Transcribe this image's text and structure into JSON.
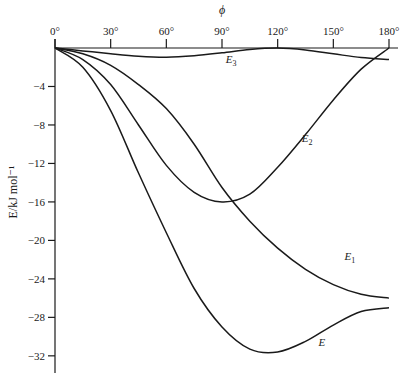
{
  "chart_data": {
    "type": "line",
    "title": "",
    "xlabel": "ϕ",
    "ylabel": "E/kJ mol⁻¹",
    "xlim": [
      0,
      180
    ],
    "ylim": [
      -34,
      0
    ],
    "x_ticks": [
      0,
      30,
      60,
      90,
      120,
      150,
      180
    ],
    "x_tick_labels": [
      "0°",
      "30°",
      "60°",
      "90°",
      "120°",
      "150°",
      "180°"
    ],
    "y_ticks": [
      -4,
      -8,
      -12,
      -16,
      -20,
      -24,
      -28,
      -32
    ],
    "y_tick_labels": [
      "−4",
      "−8",
      "−12",
      "−16",
      "−20",
      "−24",
      "−28",
      "−32"
    ],
    "x_axis_position": "top",
    "grid": false,
    "legend": "inline labels",
    "series": [
      {
        "name": "E3",
        "label_main": "E",
        "label_sub": "3",
        "x": [
          0,
          15,
          30,
          45,
          60,
          75,
          90,
          105,
          120,
          135,
          150,
          165,
          180
        ],
        "values": [
          0,
          -0.3,
          -0.6,
          -0.85,
          -0.95,
          -0.8,
          -0.5,
          -0.15,
          0,
          -0.2,
          -0.6,
          -1.0,
          -1.2
        ]
      },
      {
        "name": "E2",
        "label_main": "E",
        "label_sub": "2",
        "x": [
          0,
          15,
          30,
          45,
          60,
          75,
          90,
          105,
          120,
          135,
          150,
          165,
          180
        ],
        "values": [
          0,
          -1.2,
          -3.8,
          -8.0,
          -12.2,
          -15.0,
          -16.0,
          -15.2,
          -12.4,
          -9.0,
          -5.4,
          -2.2,
          0
        ]
      },
      {
        "name": "E1",
        "label_main": "E",
        "label_sub": "1",
        "x": [
          0,
          15,
          30,
          45,
          60,
          75,
          90,
          105,
          120,
          135,
          150,
          165,
          180
        ],
        "values": [
          0,
          -0.6,
          -1.8,
          -3.8,
          -6.3,
          -10.0,
          -14.5,
          -18.0,
          -20.8,
          -23.0,
          -24.6,
          -25.6,
          -26.0
        ]
      },
      {
        "name": "E",
        "label_main": "E",
        "label_sub": "",
        "x": [
          0,
          15,
          30,
          45,
          60,
          75,
          90,
          105,
          120,
          135,
          150,
          165,
          180
        ],
        "values": [
          0,
          -2.0,
          -6.5,
          -13.0,
          -19.2,
          -25.0,
          -29.0,
          -31.3,
          -31.6,
          -30.5,
          -28.8,
          -27.4,
          -27.0
        ]
      }
    ],
    "labels": [
      {
        "series": "E3",
        "x": 92,
        "y": -1.6
      },
      {
        "series": "E2",
        "x": 133,
        "y": -9.8
      },
      {
        "series": "E1",
        "x": 156,
        "y": -22.0
      },
      {
        "series": "E",
        "x": 142,
        "y": -31.0
      }
    ]
  }
}
